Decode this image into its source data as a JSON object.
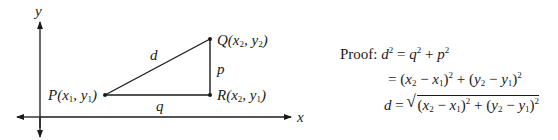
{
  "axes": {
    "x_label": "x",
    "y_label": "y"
  },
  "points": {
    "P": {
      "name": "P",
      "x": "x",
      "xs": "1",
      "y": "y",
      "ys": "1"
    },
    "Q": {
      "name": "Q",
      "x": "x",
      "xs": "2",
      "y": "y",
      "ys": "2"
    },
    "R": {
      "name": "R",
      "x": "x",
      "xs": "2",
      "y": "y",
      "ys": "1"
    }
  },
  "sides": {
    "hypotenuse": "d",
    "vertical": "p",
    "horizontal": "q"
  },
  "proof": {
    "label": "Proof:",
    "line1": {
      "lhs": "d",
      "lhs_exp": "2",
      "rhs_a": "q",
      "rhs_a_exp": "2",
      "rhs_b": "p",
      "rhs_b_exp": "2"
    },
    "line2_text": "= (x2 − x1)² + (y2 − y1)²",
    "line3_text": "d = √((x2 − x1)² + (y2 − y1)²)"
  },
  "colors": {
    "ink": "#1a1a1a",
    "background": "#ffffff"
  }
}
